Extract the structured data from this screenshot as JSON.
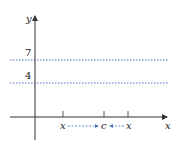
{
  "diagram": {
    "axes": {
      "x_label": "x",
      "y_label": "y",
      "color": "#333333"
    },
    "horizontal_lines": [
      {
        "label": "7",
        "style": "dotted",
        "color": "#4a6fc4"
      },
      {
        "label": "4",
        "style": "dotted",
        "color": "#4a6fc4"
      }
    ],
    "x_axis_points": [
      {
        "label": "x",
        "position": "left"
      },
      {
        "label": "c",
        "position": "center"
      },
      {
        "label": "x",
        "position": "right"
      }
    ],
    "approach_arrows": {
      "color": "#4a6fc4",
      "style": "dashed",
      "description": "x approaches c from both sides"
    }
  }
}
